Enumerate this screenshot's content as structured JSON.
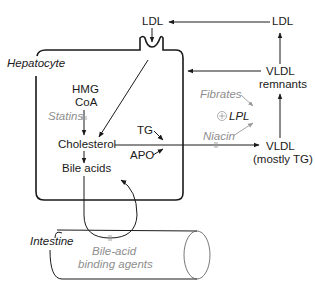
{
  "diagram": {
    "compartments": {
      "hepatocyte": "Hepatocyte",
      "intestine": "Intestine"
    },
    "nodes": {
      "ldl_receptor": "LDL",
      "ldl_plasma": "LDL",
      "vldl_remnants_line1": "VLDL",
      "vldl_remnants_line2": "remnants",
      "vldl_line1": "VLDL",
      "vldl_line2": "(mostly TG)",
      "hmg_line1": "HMG",
      "hmg_line2": "CoA",
      "cholesterol": "Cholesterol",
      "bile_acids": "Bile acids",
      "tg": "TG",
      "apo": "APO",
      "lpl": "LPL"
    },
    "drugs": {
      "statins": "Statins",
      "fibrates": "Fibrates",
      "niacin": "Niacin",
      "bile_acid_binders_line1": "Bile-acid",
      "bile_acid_binders_line2": "binding agents"
    },
    "symbols": {
      "lpl_stimulation": "⊕"
    },
    "edges": [
      {
        "from": "LDL (plasma)",
        "to": "LDL (receptor)"
      },
      {
        "from": "VLDL remnants",
        "to": "LDL (plasma)"
      },
      {
        "from": "VLDL remnants",
        "to": "Hepatocyte"
      },
      {
        "from": "VLDL (mostly TG)",
        "to": "VLDL remnants"
      },
      {
        "from": "LDL (receptor)",
        "to": "Cholesterol"
      },
      {
        "from": "HMG CoA",
        "to": "Cholesterol",
        "inhibited_by": "Statins"
      },
      {
        "from": "Cholesterol",
        "to": "Bile acids"
      },
      {
        "from": "Cholesterol",
        "to": "VLDL (mostly TG)",
        "inhibited_by": "Niacin"
      },
      {
        "from": "TG",
        "to": "Cholesterol/VLDL export"
      },
      {
        "from": "APO",
        "to": "Cholesterol/VLDL export"
      },
      {
        "from": "Fibrates",
        "to": "LPL",
        "effect": "stimulate"
      },
      {
        "from": "Niacin",
        "to": "LPL",
        "effect": "stimulate"
      },
      {
        "from": "Bile acids",
        "to": "Intestine",
        "return": "enterohepatic",
        "inhibited_by": "Bile-acid binding agents"
      }
    ]
  }
}
